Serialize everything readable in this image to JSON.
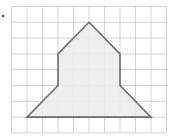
{
  "figure": {
    "type": "grid-polygon",
    "grid": {
      "columns": 10,
      "rows": 8,
      "origin_x": 11.5,
      "origin_y": 6.5,
      "cell_w": 15.5,
      "cell_h": 15.8,
      "line_color": "#d2d2d2"
    },
    "shape": {
      "vertices_grid": [
        [
          5,
          1
        ],
        [
          7,
          3
        ],
        [
          7,
          5
        ],
        [
          9,
          7
        ],
        [
          1,
          7
        ],
        [
          3,
          5
        ],
        [
          3,
          3
        ]
      ],
      "fill": "#ececec",
      "stroke": "#6b6b6b",
      "stroke_width": 1.6
    },
    "marker_dot": {
      "x": 3,
      "y": 16,
      "color": "#555555"
    }
  }
}
